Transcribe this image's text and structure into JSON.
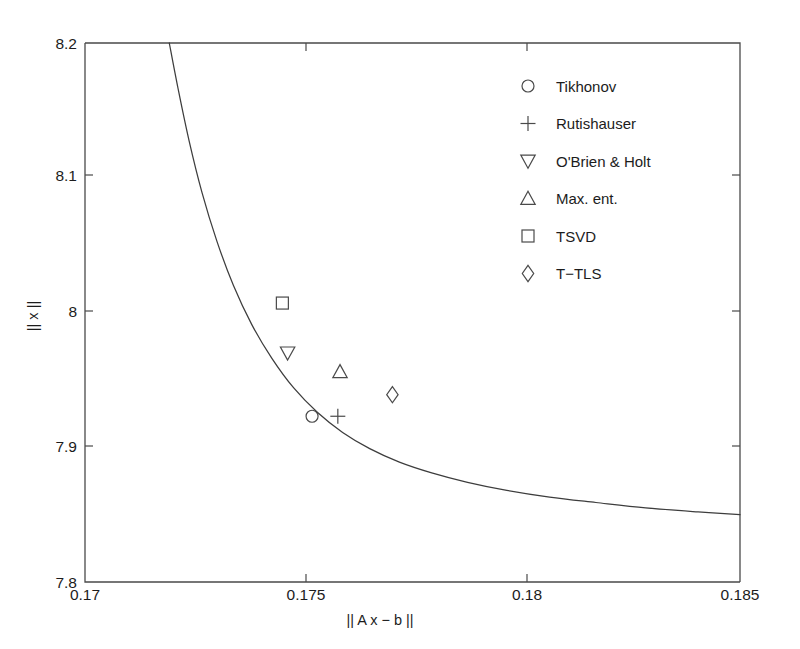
{
  "chart_data": {
    "type": "line",
    "title": "",
    "subtitle": "",
    "xlabel": "|| A x − b ||",
    "ylabel": "|| x ||",
    "xlim": [
      0.17,
      0.185
    ],
    "ylim": [
      7.8,
      8.2
    ],
    "xticks": [
      0.17,
      0.175,
      0.18,
      0.185
    ],
    "yticks": [
      7.8,
      7.9,
      8.0,
      8.1,
      8.2
    ],
    "xtick_labels": [
      "0.17",
      "0.175",
      "0.18",
      "0.185"
    ],
    "ytick_labels": [
      "7.8",
      "7.9",
      "8",
      "8.1",
      "8.2"
    ],
    "grid": false,
    "legend_position": "upper right",
    "series": [
      {
        "name": "L-curve",
        "type": "line",
        "marker": "none",
        "x": [
          0.17193,
          0.17212,
          0.17238,
          0.17268,
          0.17302,
          0.1734,
          0.17382,
          0.17428,
          0.17478,
          0.17532,
          0.1759,
          0.17652,
          0.1772,
          0.17794,
          0.17876,
          0.17966,
          0.18064,
          0.1817,
          0.18284,
          0.18404,
          0.185
        ],
        "y": [
          8.2,
          8.168,
          8.128,
          8.089,
          8.053,
          8.02,
          7.991,
          7.966,
          7.944,
          7.926,
          7.911,
          7.899,
          7.889,
          7.881,
          7.874,
          7.868,
          7.863,
          7.859,
          7.855,
          7.852,
          7.85
        ]
      },
      {
        "name": "Tikhonov",
        "type": "scatter",
        "marker": "circle",
        "x": [
          0.1752
        ],
        "y": [
          7.923
        ]
      },
      {
        "name": "Rutishauser",
        "type": "scatter",
        "marker": "plus",
        "x": [
          0.17579
        ],
        "y": [
          7.923
        ]
      },
      {
        "name": "O'Brien & Holt",
        "type": "scatter",
        "marker": "triangle-down",
        "x": [
          0.17464
        ],
        "y": [
          7.97
        ]
      },
      {
        "name": "Max. ent.",
        "type": "scatter",
        "marker": "triangle-up",
        "x": [
          0.17584
        ],
        "y": [
          7.956
        ]
      },
      {
        "name": "TSVD",
        "type": "scatter",
        "marker": "square",
        "x": [
          0.17452
        ],
        "y": [
          8.007
        ]
      },
      {
        "name": "T−TLS",
        "type": "scatter",
        "marker": "diamond",
        "x": [
          0.17704
        ],
        "y": [
          7.939
        ]
      }
    ],
    "legend": [
      {
        "label": "Tikhonov",
        "marker": "circle"
      },
      {
        "label": "Rutishauser",
        "marker": "plus"
      },
      {
        "label": "O'Brien & Holt",
        "marker": "triangle-down"
      },
      {
        "label": "Max. ent.",
        "marker": "triangle-up"
      },
      {
        "label": "TSVD",
        "marker": "square"
      },
      {
        "label": "T−TLS",
        "marker": "diamond"
      }
    ],
    "colors": {
      "axis": "#4a4a4a",
      "curve": "#3d3d3d",
      "marker": "#4a4a4a",
      "text": "#1c1c1c",
      "background": "#ffffff"
    }
  }
}
